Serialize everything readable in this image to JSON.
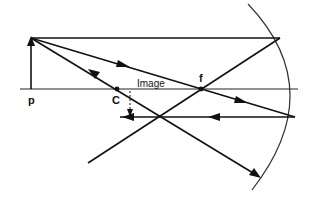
{
  "diagram": {
    "labels": {
      "object": "p",
      "center": "C",
      "focal": "f",
      "image": "Image"
    },
    "colors": {
      "line": "#111111",
      "background": "#ffffff"
    },
    "points": {
      "object_base": [
        31,
        89
      ],
      "object_tip": [
        31,
        38
      ],
      "center_of_curvature": [
        117,
        89
      ],
      "focal_point": [
        201,
        89
      ],
      "image_tip": [
        130,
        117
      ],
      "mirror_top_hit": [
        280,
        38
      ],
      "mirror_low_hit": [
        295,
        117
      ]
    }
  }
}
